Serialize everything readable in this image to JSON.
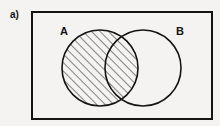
{
  "figure": {
    "part_label": "a)",
    "background_color": "#f4f3f1",
    "stroke_color": "#141414",
    "hatch_color": "#141414"
  },
  "universal_set": {
    "name": "rectangle-universal-set",
    "x": 32,
    "y": 12,
    "width": 180,
    "height": 107,
    "stroke_width": 2
  },
  "sets": [
    {
      "id": "A",
      "label": "A",
      "cx": 100,
      "cy": 68,
      "r": 38,
      "shaded": true,
      "fill": "hatch-45",
      "stroke_width": 1.6
    },
    {
      "id": "B",
      "label": "B",
      "cx": 143,
      "cy": 68,
      "r": 38,
      "shaded": false,
      "fill": "none",
      "stroke_width": 1.6
    }
  ],
  "hatch": {
    "angle_degrees": 45,
    "direction": "lower-left-to-upper-right",
    "spacing_px": 6,
    "line_width": 1
  }
}
